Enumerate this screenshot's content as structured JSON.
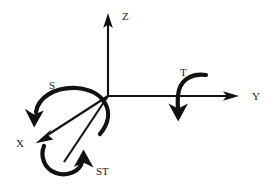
{
  "figure": {
    "background_color": "#ffffff",
    "stroke_color": "#111111",
    "origin": {
      "x": 108,
      "y": 96
    }
  },
  "axes": [
    {
      "id": "z",
      "label": "Z",
      "label_x": 122,
      "label_y": 20,
      "direction": "up",
      "from": {
        "x": 108,
        "y": 96
      },
      "to": {
        "x": 108,
        "y": 16
      }
    },
    {
      "id": "y",
      "label": "Y",
      "label_x": 252,
      "label_y": 100,
      "direction": "right",
      "from": {
        "x": 108,
        "y": 96
      },
      "to": {
        "x": 239,
        "y": 96
      }
    },
    {
      "id": "x",
      "label": "X",
      "label_x": 16,
      "label_y": 147,
      "direction": "down-left",
      "from": {
        "x": 108,
        "y": 96
      },
      "to": {
        "x": 36,
        "y": 143
      }
    }
  ],
  "rotations": [
    {
      "id": "s",
      "label": "S",
      "label_x": 49,
      "label_y": 89,
      "description": "arc over X axis, arrowhead pointing down-left",
      "about_axis": "X"
    },
    {
      "id": "t",
      "label": "T",
      "label_x": 180,
      "label_y": 76,
      "description": "hook curve crossing Y axis, arrowhead pointing down",
      "about_axis": "Y"
    },
    {
      "id": "st",
      "label": "ST",
      "label_x": 96,
      "label_y": 175,
      "description": "circular arc below origin, arrowhead pointing up-right",
      "about_axis": "composite"
    }
  ]
}
